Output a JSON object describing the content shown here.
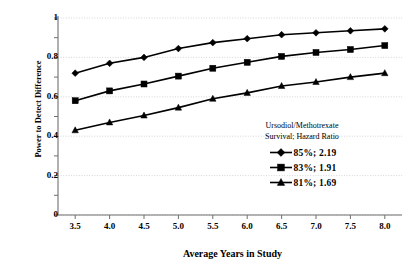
{
  "chart_data": {
    "type": "line",
    "title": "",
    "xlabel": "Average Years in Study",
    "ylabel": "Power to Detect Difference",
    "xlim": [
      3.25,
      8.25
    ],
    "ylim": [
      0,
      1
    ],
    "grid": true,
    "legend_position": "inside-lower-right",
    "legend_title_lines": [
      "Ursodiol/Methotrexate",
      "Survival; Hazard Ratio"
    ],
    "xticks": [
      "3.5",
      "4.0",
      "4.5",
      "5.0",
      "5.5",
      "6.0",
      "6.5",
      "7.0",
      "7.5",
      "8.0"
    ],
    "yticks": [
      "0",
      "0.2",
      "0.4",
      "0.6",
      "0.8",
      "1"
    ],
    "x": [
      3.5,
      4.0,
      4.5,
      5.0,
      5.5,
      6.0,
      6.5,
      7.0,
      7.5,
      8.0
    ],
    "series": [
      {
        "name": "85%; 2.19",
        "marker": "diamond",
        "survival": "85%",
        "hazard_ratio": "2.19",
        "values": [
          0.72,
          0.77,
          0.8,
          0.845,
          0.875,
          0.895,
          0.915,
          0.925,
          0.935,
          0.945
        ]
      },
      {
        "name": "83%; 1.91",
        "marker": "square",
        "survival": "83%",
        "hazard_ratio": "1.91",
        "values": [
          0.58,
          0.63,
          0.665,
          0.705,
          0.745,
          0.775,
          0.805,
          0.825,
          0.84,
          0.86
        ]
      },
      {
        "name": "81%; 1.69",
        "marker": "triangle",
        "survival": "81%",
        "hazard_ratio": "1.69",
        "values": [
          0.43,
          0.47,
          0.505,
          0.545,
          0.59,
          0.62,
          0.655,
          0.675,
          0.7,
          0.72
        ]
      }
    ]
  },
  "colors": {
    "line": "#000000",
    "grid": "#b9b9b9",
    "axis": "#6f6f6f",
    "background": "#ffffff"
  }
}
